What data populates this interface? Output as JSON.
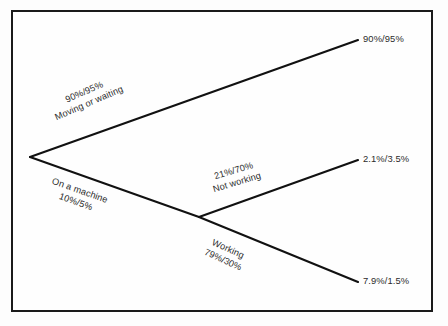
{
  "figure": {
    "type": "probability-tree-diagram",
    "background_color": "#fdfdfd",
    "line_color": "#111111",
    "text_color": "#2b2b2b",
    "border_color": "#1a1a1a"
  },
  "tree": {
    "root": {
      "x": 30,
      "y": 157
    },
    "branches": [
      {
        "id": "moving-or-waiting",
        "label_line1": "90%/95%",
        "label_line2": "Moving or waiting",
        "from": {
          "x": 30,
          "y": 157
        },
        "to": {
          "x": 358,
          "y": 40
        },
        "endpoint_label": "90%/95%"
      },
      {
        "id": "on-a-machine",
        "label_line1": "On a machine",
        "label_line2": "10%/5%",
        "from": {
          "x": 30,
          "y": 157
        },
        "to": {
          "x": 199,
          "y": 217
        },
        "endpoint_label": ""
      },
      {
        "id": "not-working",
        "label_line1": "21%/70%",
        "label_line2": "Not working",
        "from": {
          "x": 199,
          "y": 217
        },
        "to": {
          "x": 358,
          "y": 160
        },
        "endpoint_label": "2.1%/3.5%"
      },
      {
        "id": "working",
        "label_line1": "Working",
        "label_line2": "79%/30%",
        "from": {
          "x": 199,
          "y": 217
        },
        "to": {
          "x": 358,
          "y": 282
        },
        "endpoint_label": "7.9%/1.5%"
      }
    ],
    "endpoints": [
      {
        "id": "endpoint-moving-or-waiting",
        "label": "90%/95%"
      },
      {
        "id": "endpoint-not-working",
        "label": "2.1%/3.5%"
      },
      {
        "id": "endpoint-working",
        "label": "7.9%/1.5%"
      }
    ]
  }
}
